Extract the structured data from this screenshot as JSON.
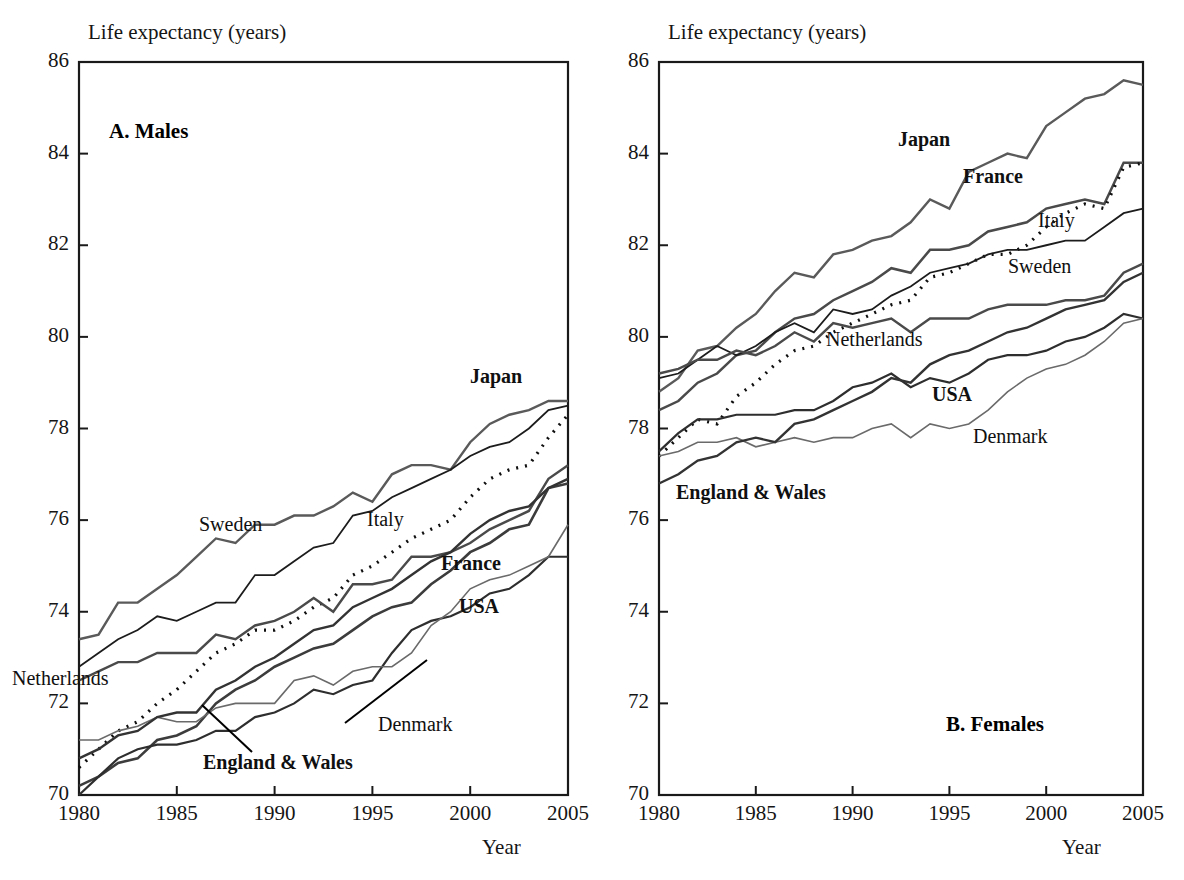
{
  "figure": {
    "width": 1184,
    "height": 880,
    "background": "#ffffff",
    "ink_color": "#1a1a1a"
  },
  "chart_data": [
    {
      "type": "line",
      "panel_id": "A",
      "title": "A. Males",
      "ylabel": "Life expectancy (years)",
      "xlabel": "Year",
      "xlim": [
        1980,
        2005
      ],
      "ylim": [
        70,
        86
      ],
      "xticks": [
        1980,
        1985,
        1990,
        1995,
        2000,
        2005
      ],
      "yticks": [
        70,
        72,
        74,
        76,
        78,
        80,
        82,
        84,
        86
      ],
      "grid": false,
      "legend_position": "inline-annotations",
      "x": [
        1980,
        1981,
        1982,
        1983,
        1984,
        1985,
        1986,
        1987,
        1988,
        1989,
        1990,
        1991,
        1992,
        1993,
        1994,
        1995,
        1996,
        1997,
        1998,
        1999,
        2000,
        2001,
        2002,
        2003,
        2004,
        2005
      ],
      "series": [
        {
          "name": "Japan",
          "label_bold": true,
          "stroke": "#5a5a5a",
          "stroke_width": 2.4,
          "dash": "none",
          "values": [
            73.4,
            73.5,
            74.2,
            74.2,
            74.5,
            74.8,
            75.2,
            75.6,
            75.5,
            75.9,
            75.9,
            76.1,
            76.1,
            76.3,
            76.6,
            76.4,
            77.0,
            77.2,
            77.2,
            77.1,
            77.7,
            78.1,
            78.3,
            78.4,
            78.6,
            78.6
          ]
        },
        {
          "name": "Sweden",
          "label_bold": false,
          "stroke": "#1c1c1c",
          "stroke_width": 1.8,
          "dash": "none",
          "values": [
            72.8,
            73.1,
            73.4,
            73.6,
            73.9,
            73.8,
            74.0,
            74.2,
            74.2,
            74.8,
            74.8,
            75.1,
            75.4,
            75.5,
            76.1,
            76.2,
            76.5,
            76.7,
            76.9,
            77.1,
            77.4,
            77.6,
            77.7,
            78.0,
            78.4,
            78.5
          ]
        },
        {
          "name": "Italy",
          "label_bold": false,
          "stroke": "#0f0f0f",
          "stroke_width": 3.2,
          "dash": "2,7",
          "values": [
            70.6,
            71.0,
            71.4,
            71.6,
            72.0,
            72.3,
            72.7,
            73.1,
            73.3,
            73.6,
            73.6,
            73.8,
            74.1,
            74.3,
            74.8,
            75.0,
            75.3,
            75.6,
            75.8,
            76.0,
            76.5,
            76.9,
            77.1,
            77.2,
            77.8,
            78.3
          ]
        },
        {
          "name": "Netherlands",
          "label_bold": false,
          "stroke": "#4a4a4a",
          "stroke_width": 2.4,
          "dash": "none",
          "values": [
            72.5,
            72.7,
            72.9,
            72.9,
            73.1,
            73.1,
            73.1,
            73.5,
            73.4,
            73.7,
            73.8,
            74.0,
            74.3,
            74.0,
            74.6,
            74.6,
            74.7,
            75.2,
            75.2,
            75.3,
            75.5,
            75.8,
            76.0,
            76.2,
            76.9,
            77.2
          ]
        },
        {
          "name": "France",
          "label_bold": true,
          "stroke": "#3c3c3c",
          "stroke_width": 2.6,
          "dash": "none",
          "values": [
            70.2,
            70.4,
            70.7,
            70.8,
            71.2,
            71.3,
            71.5,
            72.0,
            72.3,
            72.5,
            72.8,
            73.0,
            73.2,
            73.3,
            73.6,
            73.9,
            74.1,
            74.2,
            74.6,
            74.9,
            75.3,
            75.5,
            75.8,
            75.9,
            76.7,
            76.8
          ]
        },
        {
          "name": "USA",
          "label_bold": true,
          "stroke": "#2e2e2e",
          "stroke_width": 2.2,
          "dash": "none",
          "values": [
            70.0,
            70.4,
            70.8,
            71.0,
            71.1,
            71.1,
            71.2,
            71.4,
            71.4,
            71.7,
            71.8,
            72.0,
            72.3,
            72.2,
            72.4,
            72.5,
            73.1,
            73.6,
            73.8,
            73.9,
            74.1,
            74.4,
            74.5,
            74.8,
            75.2,
            75.2
          ]
        },
        {
          "name": "Denmark",
          "label_bold": false,
          "stroke": "#6a6a6a",
          "stroke_width": 1.6,
          "dash": "none",
          "values": [
            71.2,
            71.2,
            71.4,
            71.5,
            71.7,
            71.6,
            71.6,
            71.9,
            72.0,
            72.0,
            72.0,
            72.5,
            72.6,
            72.4,
            72.7,
            72.8,
            72.8,
            73.1,
            73.7,
            74.0,
            74.5,
            74.7,
            74.8,
            75.0,
            75.2,
            75.9
          ]
        },
        {
          "name": "England & Wales",
          "label_bold": true,
          "stroke": "#333333",
          "stroke_width": 2.4,
          "dash": "none",
          "values": [
            70.8,
            71.0,
            71.3,
            71.4,
            71.7,
            71.8,
            71.8,
            72.3,
            72.5,
            72.8,
            73.0,
            73.3,
            73.6,
            73.7,
            74.1,
            74.3,
            74.5,
            74.8,
            75.1,
            75.3,
            75.7,
            76.0,
            76.2,
            76.3,
            76.7,
            76.9
          ]
        }
      ],
      "annotations": [
        {
          "text": "Japan",
          "x_px": 470,
          "y_px": 378,
          "bold": true
        },
        {
          "text": "Sweden",
          "x_px": 199,
          "y_px": 526,
          "bold": false
        },
        {
          "text": "Italy",
          "x_px": 367,
          "y_px": 521,
          "bold": false
        },
        {
          "text": "France",
          "x_px": 441,
          "y_px": 565,
          "bold": true
        },
        {
          "text": "USA",
          "x_px": 459,
          "y_px": 608,
          "bold": true
        },
        {
          "text": "Netherlands",
          "x_px": 12,
          "y_px": 680,
          "bold": false
        },
        {
          "text": "Denmark",
          "x_px": 378,
          "y_px": 726,
          "bold": false
        },
        {
          "text": "England & Wales",
          "x_px": 203,
          "y_px": 764,
          "bold": true
        }
      ],
      "leaders": [
        {
          "from_px": [
            345,
            723
          ],
          "to_px": [
            427,
            660
          ]
        },
        {
          "from_px": [
            252,
            752
          ],
          "to_px": [
            202,
            705
          ]
        }
      ]
    },
    {
      "type": "line",
      "panel_id": "B",
      "title": "B. Females",
      "ylabel": "Life expectancy (years)",
      "xlabel": "Year",
      "xlim": [
        1980,
        2005
      ],
      "ylim": [
        70,
        86
      ],
      "xticks": [
        1980,
        1985,
        1990,
        1995,
        2000,
        2005
      ],
      "yticks": [
        70,
        72,
        74,
        76,
        78,
        80,
        82,
        84,
        86
      ],
      "grid": false,
      "legend_position": "inline-annotations",
      "x": [
        1980,
        1981,
        1982,
        1983,
        1984,
        1985,
        1986,
        1987,
        1988,
        1989,
        1990,
        1991,
        1992,
        1993,
        1994,
        1995,
        1996,
        1997,
        1998,
        1999,
        2000,
        2001,
        2002,
        2003,
        2004,
        2005
      ],
      "series": [
        {
          "name": "Japan",
          "label_bold": true,
          "stroke": "#5a5a5a",
          "stroke_width": 2.4,
          "dash": "none",
          "values": [
            78.8,
            79.1,
            79.7,
            79.8,
            80.2,
            80.5,
            81.0,
            81.4,
            81.3,
            81.8,
            81.9,
            82.1,
            82.2,
            82.5,
            83.0,
            82.8,
            83.6,
            83.8,
            84.0,
            83.9,
            84.6,
            84.9,
            85.2,
            85.3,
            85.6,
            85.5
          ]
        },
        {
          "name": "France",
          "label_bold": true,
          "stroke": "#4a4a4a",
          "stroke_width": 2.5,
          "dash": "none",
          "values": [
            78.4,
            78.6,
            79.0,
            79.2,
            79.6,
            79.7,
            80.1,
            80.4,
            80.5,
            80.8,
            81.0,
            81.2,
            81.5,
            81.4,
            81.9,
            81.9,
            82.0,
            82.3,
            82.4,
            82.5,
            82.8,
            82.9,
            83.0,
            82.9,
            83.8,
            83.8
          ]
        },
        {
          "name": "Italy",
          "label_bold": false,
          "stroke": "#0f0f0f",
          "stroke_width": 3.2,
          "dash": "2,7",
          "values": [
            77.4,
            77.8,
            78.2,
            78.1,
            78.7,
            79.0,
            79.4,
            79.7,
            79.8,
            80.1,
            80.3,
            80.5,
            80.7,
            80.8,
            81.3,
            81.4,
            81.6,
            81.8,
            81.8,
            82.0,
            82.4,
            82.7,
            82.9,
            82.8,
            83.7,
            83.8
          ]
        },
        {
          "name": "Sweden",
          "label_bold": false,
          "stroke": "#1c1c1c",
          "stroke_width": 1.8,
          "dash": "none",
          "values": [
            79.1,
            79.2,
            79.5,
            79.8,
            79.6,
            79.8,
            80.1,
            80.3,
            80.1,
            80.6,
            80.5,
            80.6,
            80.9,
            81.1,
            81.4,
            81.5,
            81.6,
            81.8,
            81.9,
            81.9,
            82.0,
            82.1,
            82.1,
            82.4,
            82.7,
            82.8
          ]
        },
        {
          "name": "Netherlands",
          "label_bold": false,
          "stroke": "#4a4a4a",
          "stroke_width": 2.4,
          "dash": "none",
          "values": [
            79.2,
            79.3,
            79.5,
            79.5,
            79.7,
            79.6,
            79.8,
            80.1,
            79.9,
            80.3,
            80.2,
            80.3,
            80.4,
            80.1,
            80.4,
            80.4,
            80.4,
            80.6,
            80.7,
            80.7,
            80.7,
            80.8,
            80.8,
            80.9,
            81.4,
            81.6
          ]
        },
        {
          "name": "USA",
          "label_bold": true,
          "stroke": "#2e2e2e",
          "stroke_width": 2.2,
          "dash": "none",
          "values": [
            77.5,
            77.9,
            78.2,
            78.2,
            78.3,
            78.3,
            78.3,
            78.4,
            78.4,
            78.6,
            78.9,
            79.0,
            79.2,
            78.9,
            79.1,
            79.0,
            79.2,
            79.5,
            79.6,
            79.6,
            79.7,
            79.9,
            80.0,
            80.2,
            80.5,
            80.4
          ]
        },
        {
          "name": "Denmark",
          "label_bold": false,
          "stroke": "#6a6a6a",
          "stroke_width": 1.6,
          "dash": "none",
          "values": [
            77.4,
            77.5,
            77.7,
            77.7,
            77.8,
            77.6,
            77.7,
            77.8,
            77.7,
            77.8,
            77.8,
            78.0,
            78.1,
            77.8,
            78.1,
            78.0,
            78.1,
            78.4,
            78.8,
            79.1,
            79.3,
            79.4,
            79.6,
            79.9,
            80.3,
            80.4
          ]
        },
        {
          "name": "England & Wales",
          "label_bold": true,
          "stroke": "#333333",
          "stroke_width": 2.4,
          "dash": "none",
          "values": [
            76.8,
            77.0,
            77.3,
            77.4,
            77.7,
            77.8,
            77.7,
            78.1,
            78.2,
            78.4,
            78.6,
            78.8,
            79.1,
            79.0,
            79.4,
            79.6,
            79.7,
            79.9,
            80.1,
            80.2,
            80.4,
            80.6,
            80.7,
            80.8,
            81.2,
            81.4
          ]
        }
      ],
      "annotations": [
        {
          "text": "Japan",
          "x_px": 898,
          "y_px": 141,
          "bold": true
        },
        {
          "text": "France",
          "x_px": 963,
          "y_px": 178,
          "bold": true
        },
        {
          "text": "Italy",
          "x_px": 1038,
          "y_px": 222,
          "bold": false
        },
        {
          "text": "Sweden",
          "x_px": 1008,
          "y_px": 268,
          "bold": false
        },
        {
          "text": "Netherlands",
          "x_px": 826,
          "y_px": 341,
          "bold": false
        },
        {
          "text": "USA",
          "x_px": 932,
          "y_px": 396,
          "bold": true
        },
        {
          "text": "Denmark",
          "x_px": 973,
          "y_px": 438,
          "bold": false
        },
        {
          "text": "B. Females",
          "x_px": 946,
          "y_px": 726,
          "bold": true
        },
        {
          "text": "England & Wales",
          "x_px": 676,
          "y_px": 494,
          "bold": true
        }
      ],
      "leaders": []
    }
  ],
  "panels": {
    "a": {
      "caption": "A. Males",
      "caption_x_px": 109,
      "caption_y_px": 131,
      "y_axis_title": "Life expectancy (years)",
      "x_axis_title": "Year",
      "y_tick_labels": [
        "86",
        "84",
        "82",
        "80",
        "78",
        "76",
        "74",
        "72",
        "70"
      ],
      "x_tick_labels": [
        "1980",
        "1985",
        "1990",
        "1995",
        "2000",
        "2005"
      ]
    },
    "b": {
      "caption": "B. Females",
      "caption_x_px": 946,
      "caption_y_px": 726,
      "y_axis_title": "Life expectancy (years)",
      "x_axis_title": "Year",
      "y_tick_labels": [
        "86",
        "84",
        "82",
        "80",
        "78",
        "76",
        "74",
        "72",
        "70"
      ],
      "x_tick_labels": [
        "1980",
        "1985",
        "1990",
        "1995",
        "2000",
        "2005"
      ]
    }
  }
}
